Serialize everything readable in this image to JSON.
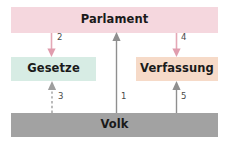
{
  "diagram": {
    "title": "Parlament Gesetze Verfassung Volk",
    "nodes": {
      "parlament": {
        "label": "Parlament",
        "color": "#f5d7de"
      },
      "gesetze": {
        "label": "Gesetze",
        "color": "#d7ece4"
      },
      "verfassung": {
        "label": "Verfassung",
        "color": "#f6dac8"
      },
      "volk": {
        "label": "Volk",
        "color": "#a2a2a2"
      }
    },
    "edges": [
      {
        "id": "1",
        "label": "1",
        "from": "volk",
        "to": "parlament",
        "direction": "up",
        "style": "solid",
        "color": "#8c8c8c"
      },
      {
        "id": "2",
        "label": "2",
        "from": "parlament",
        "to": "gesetze",
        "direction": "down",
        "style": "solid",
        "color": "#e4a8b6"
      },
      {
        "id": "3",
        "label": "3",
        "from": "volk",
        "to": "gesetze",
        "direction": "up",
        "style": "dashed",
        "color": "#9a9a9a"
      },
      {
        "id": "4",
        "label": "4",
        "from": "parlament",
        "to": "verfassung",
        "direction": "down",
        "style": "solid",
        "color": "#e4a8b6"
      },
      {
        "id": "5",
        "label": "5",
        "from": "volk",
        "to": "verfassung",
        "direction": "up",
        "style": "solid",
        "color": "#8c8c8c"
      }
    ]
  }
}
